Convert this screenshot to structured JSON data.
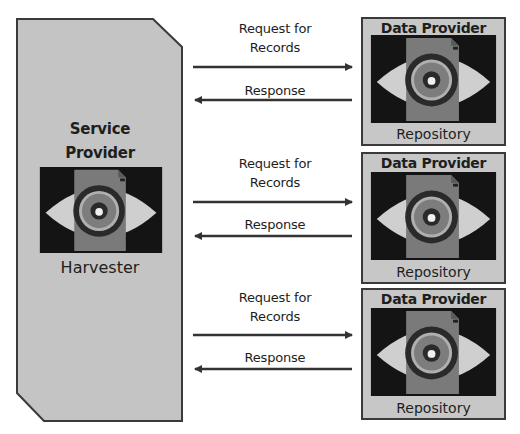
{
  "colors": {
    "panel_fill": "#c4c4c4",
    "panel_stroke": "#3a3a3a",
    "icon_bg": "#141414",
    "eye": "#cfcfcf",
    "document": "#7a7a7a",
    "ring_dark": "#2a2a2a",
    "ring_light": "#b0b0b0",
    "arrow": "#333333"
  },
  "service_provider": {
    "title_line1": "Service",
    "title_line2": "Provider",
    "subtitle": "Harvester",
    "icon": "eye-document-icon"
  },
  "data_providers": [
    {
      "title": "Data Provider",
      "subtitle": "Repository",
      "icon": "eye-document-icon"
    },
    {
      "title": "Data Provider",
      "subtitle": "Repository",
      "icon": "eye-document-icon"
    },
    {
      "title": "Data Provider",
      "subtitle": "Repository",
      "icon": "eye-document-icon"
    }
  ],
  "exchanges": [
    {
      "request_line1": "Request for",
      "request_line2": "Records",
      "response": "Response"
    },
    {
      "request_line1": "Request for",
      "request_line2": "Records",
      "response": "Response"
    },
    {
      "request_line1": "Request for",
      "request_line2": "Records",
      "response": "Response"
    }
  ]
}
